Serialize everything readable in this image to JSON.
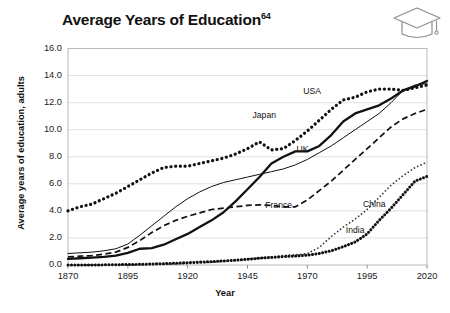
{
  "header": {
    "title": "Average Years of Education",
    "title_superscript": "64",
    "icon": "graduation-cap-icon"
  },
  "chart_data": {
    "type": "line",
    "title": "Average Years of Education",
    "xlabel": "Year",
    "ylabel": "Average years of education, adults",
    "xlim": [
      1870,
      2020
    ],
    "ylim": [
      0.0,
      16.0
    ],
    "grid": true,
    "legend": "inline-labels",
    "xticks": [
      "1870",
      "1895",
      "1920",
      "1945",
      "1970",
      "1995",
      "2020"
    ],
    "xtick_values": [
      1870,
      1895,
      1920,
      1945,
      1970,
      1995,
      2020
    ],
    "yticks": [
      "0.0",
      "2.0",
      "4.0",
      "6.0",
      "8.0",
      "10.0",
      "12.0",
      "14.0",
      "16.0"
    ],
    "ytick_values": [
      0,
      2,
      4,
      6,
      8,
      10,
      12,
      14,
      16
    ],
    "series": [
      {
        "name": "USA",
        "style": "dotted-thick",
        "color": "#111111",
        "label_x": 1972,
        "label_y": 12.85,
        "x": [
          1870,
          1875,
          1880,
          1885,
          1890,
          1895,
          1900,
          1905,
          1910,
          1915,
          1920,
          1925,
          1930,
          1935,
          1940,
          1945,
          1950,
          1955,
          1960,
          1965,
          1970,
          1975,
          1980,
          1985,
          1990,
          1995,
          2000,
          2005,
          2010,
          2015,
          2020
        ],
        "values": [
          4.0,
          4.3,
          4.5,
          4.9,
          5.3,
          5.8,
          6.3,
          6.8,
          7.2,
          7.3,
          7.3,
          7.5,
          7.7,
          7.9,
          8.2,
          8.6,
          9.1,
          8.5,
          8.6,
          9.2,
          9.9,
          10.7,
          11.5,
          12.2,
          12.4,
          12.8,
          13.0,
          13.0,
          12.9,
          13.1,
          13.3
        ]
      },
      {
        "name": "Japan",
        "style": "solid-thick",
        "color": "#111111",
        "label_x": 1952,
        "label_y": 11.1,
        "x": [
          1870,
          1875,
          1880,
          1885,
          1890,
          1895,
          1900,
          1905,
          1910,
          1915,
          1920,
          1925,
          1930,
          1935,
          1940,
          1945,
          1950,
          1955,
          1960,
          1965,
          1970,
          1975,
          1980,
          1985,
          1990,
          1995,
          2000,
          2005,
          2010,
          2015,
          2020
        ],
        "values": [
          0.45,
          0.5,
          0.55,
          0.6,
          0.7,
          0.9,
          1.2,
          1.25,
          1.5,
          1.9,
          2.3,
          2.8,
          3.3,
          3.9,
          4.7,
          5.6,
          6.5,
          7.5,
          8.0,
          8.4,
          8.4,
          8.8,
          9.6,
          10.6,
          11.2,
          11.5,
          11.8,
          12.3,
          12.9,
          13.2,
          13.6
        ]
      },
      {
        "name": "UK",
        "style": "solid-thin",
        "color": "#111111",
        "label_x": 1968,
        "label_y": 8.6,
        "x": [
          1870,
          1875,
          1880,
          1885,
          1890,
          1895,
          1900,
          1905,
          1910,
          1915,
          1920,
          1925,
          1930,
          1935,
          1940,
          1945,
          1950,
          1955,
          1960,
          1965,
          1970,
          1975,
          1980,
          1985,
          1990,
          1995,
          2000,
          2005,
          2010,
          2015,
          2020
        ],
        "values": [
          0.85,
          0.9,
          0.95,
          1.05,
          1.2,
          1.55,
          2.2,
          2.9,
          3.6,
          4.3,
          4.9,
          5.4,
          5.8,
          6.1,
          6.3,
          6.5,
          6.7,
          6.9,
          7.1,
          7.4,
          7.8,
          8.3,
          8.8,
          9.4,
          10.0,
          10.6,
          11.2,
          12.0,
          12.9,
          13.3,
          13.4
        ]
      },
      {
        "name": "France",
        "style": "dashed",
        "color": "#111111",
        "label_x": 1958,
        "label_y": 4.45,
        "x": [
          1870,
          1875,
          1880,
          1885,
          1890,
          1895,
          1900,
          1905,
          1910,
          1915,
          1920,
          1925,
          1930,
          1935,
          1940,
          1945,
          1950,
          1955,
          1960,
          1965,
          1970,
          1975,
          1980,
          1985,
          1990,
          1995,
          2000,
          2005,
          2010,
          2015,
          2020
        ],
        "values": [
          0.6,
          0.65,
          0.7,
          0.8,
          0.95,
          1.3,
          1.8,
          2.4,
          2.9,
          3.3,
          3.6,
          3.85,
          4.1,
          4.2,
          4.3,
          4.4,
          4.45,
          4.4,
          4.3,
          4.3,
          4.8,
          5.5,
          6.2,
          7.0,
          7.8,
          8.6,
          9.4,
          10.2,
          10.8,
          11.2,
          11.5
        ]
      },
      {
        "name": "China",
        "style": "dotted-fine",
        "color": "#333333",
        "label_x": 1998,
        "label_y": 4.5,
        "x": [
          1870,
          1880,
          1890,
          1900,
          1910,
          1920,
          1930,
          1940,
          1945,
          1950,
          1955,
          1960,
          1965,
          1970,
          1975,
          1980,
          1985,
          1990,
          1995,
          2000,
          2005,
          2010,
          2015,
          2020
        ],
        "values": [
          0.0,
          0.0,
          0.0,
          0.02,
          0.05,
          0.1,
          0.2,
          0.35,
          0.45,
          0.5,
          0.6,
          0.7,
          0.75,
          0.85,
          1.3,
          2.1,
          2.8,
          3.4,
          4.1,
          5.0,
          5.9,
          6.6,
          7.2,
          7.6
        ]
      },
      {
        "name": "India",
        "style": "dotted-beaded",
        "color": "#111111",
        "label_x": 1990,
        "label_y": 2.6,
        "x": [
          1870,
          1880,
          1890,
          1900,
          1910,
          1920,
          1930,
          1940,
          1945,
          1950,
          1955,
          1960,
          1965,
          1970,
          1975,
          1980,
          1985,
          1990,
          1995,
          2000,
          2005,
          2010,
          2015,
          2020
        ],
        "values": [
          0.0,
          0.0,
          0.02,
          0.05,
          0.1,
          0.17,
          0.25,
          0.35,
          0.42,
          0.5,
          0.56,
          0.62,
          0.66,
          0.72,
          0.85,
          1.05,
          1.35,
          1.7,
          2.3,
          3.3,
          4.2,
          5.2,
          6.2,
          6.55
        ]
      }
    ]
  },
  "axis": {
    "x_title": "Year",
    "y_title": "Average years of education, adults"
  }
}
